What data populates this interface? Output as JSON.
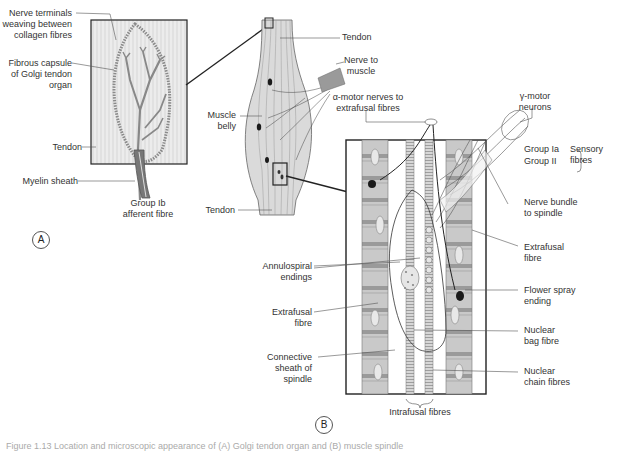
{
  "figure": {
    "panel_a": {
      "marker": "A",
      "labels": {
        "nerve_terminals": [
          "Nerve terminals",
          "weaving between",
          "collagen fibres"
        ],
        "fibrous_capsule": [
          "Fibrous capsule",
          "of Golgi tendon",
          "organ"
        ],
        "tendon": "Tendon",
        "myelin_sheath": "Myelin sheath",
        "group_ib": [
          "Group Ib",
          "afferent fibre"
        ]
      }
    },
    "muscle": {
      "labels": {
        "tendon_top": "Tendon",
        "nerve_to_muscle": [
          "Nerve to",
          "muscle"
        ],
        "muscle_belly": [
          "Muscle",
          "belly"
        ],
        "tendon_bottom": "Tendon"
      }
    },
    "panel_b": {
      "marker": "B",
      "labels": {
        "alpha_motor": [
          "α-motor nerves to",
          "extrafusal fibres"
        ],
        "gamma_motor": [
          "γ-motor",
          "neurons"
        ],
        "group_ia": "Group Ia",
        "group_ii": "Group II",
        "sensory_fibres": [
          "Sensory",
          "fibres"
        ],
        "nerve_bundle": [
          "Nerve bundle",
          "to spindle"
        ],
        "extrafusal_right": [
          "Extrafusal",
          "fibre"
        ],
        "flower_spray": [
          "Flower spray",
          "ending"
        ],
        "nuclear_bag": [
          "Nuclear",
          "bag fibre"
        ],
        "nuclear_chain": [
          "Nuclear",
          "chain fibres"
        ],
        "annulospiral": [
          "Annulospiral",
          "endings"
        ],
        "extrafusal_left": [
          "Extrafusal",
          "fibre"
        ],
        "connective_sheath": [
          "Connective",
          "sheath of",
          "spindle"
        ],
        "intrafusal": "Intrafusal fibres"
      }
    },
    "caption": "Figure 1.13 Location and microscopic appearance of (A) Golgi tendon organ and (B) muscle spindle"
  },
  "colors": {
    "line": "#222222",
    "tendon_fill": "#e4e4e4",
    "muscle_fill": "#d6d6d6",
    "fibre_fill": "#bdbdbd",
    "fibre_band": "#8a8a8a",
    "nucleus": "#1a1a1a"
  }
}
